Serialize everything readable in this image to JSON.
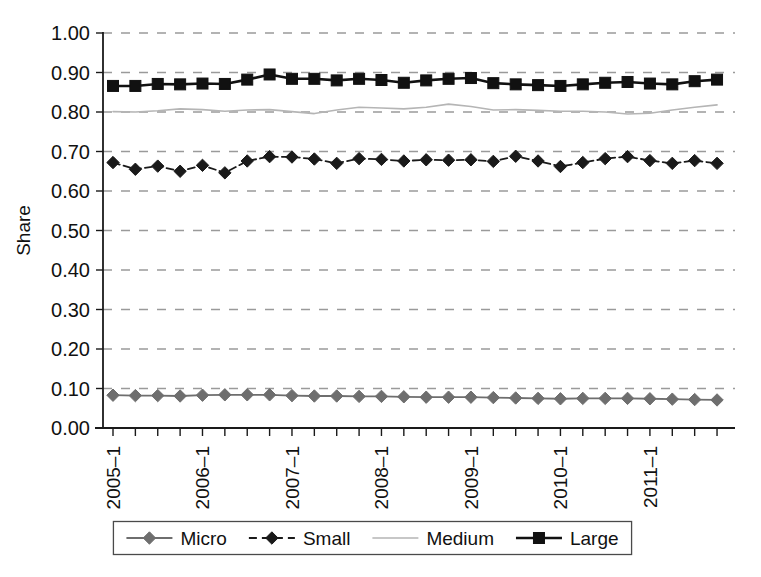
{
  "figure": {
    "background": "#ffffff",
    "axis_color": "#1a1a1a",
    "grid_color": "#9a9a9a"
  },
  "chart_data": {
    "type": "line",
    "title": "",
    "xlabel": "",
    "ylabel": "Share",
    "ylim": [
      0.0,
      1.0
    ],
    "ytick_labels": [
      "1.00",
      "0.90",
      "0.80",
      "0.70",
      "0.60",
      "0.50",
      "0.40",
      "0.30",
      "0.20",
      "0.10",
      "0.00"
    ],
    "ytick_values": [
      1.0,
      0.9,
      0.8,
      0.7,
      0.6,
      0.5,
      0.4,
      0.3,
      0.2,
      0.1,
      0.0
    ],
    "grid": true,
    "grid_style": "dashed-horizontal",
    "legend_position": "bottom-outside",
    "x": [
      "2005-1",
      "2005-2",
      "2005-3",
      "2005-4",
      "2006-1",
      "2006-2",
      "2006-3",
      "2006-4",
      "2007-1",
      "2007-2",
      "2007-3",
      "2007-4",
      "2008-1",
      "2008-2",
      "2008-3",
      "2008-4",
      "2009-1",
      "2009-2",
      "2009-3",
      "2009-4",
      "2010-1",
      "2010-2",
      "2010-3",
      "2010-4",
      "2011-1",
      "2011-2",
      "2011-3",
      "2011-4"
    ],
    "xtick_labels_shown": [
      "2005–1",
      "2006–1",
      "2007–1",
      "2008–1",
      "2009–1",
      "2010–1",
      "2011–1"
    ],
    "xtick_label_indices": [
      0,
      4,
      8,
      12,
      16,
      20,
      24
    ],
    "xtick_label_rotation": -90,
    "series": [
      {
        "name": "Micro",
        "color": "#6e6e6e",
        "marker": "diamond",
        "line_style": "solid",
        "line_width": 1.8,
        "values": [
          0.083,
          0.082,
          0.082,
          0.081,
          0.083,
          0.084,
          0.084,
          0.084,
          0.082,
          0.081,
          0.081,
          0.08,
          0.08,
          0.079,
          0.078,
          0.078,
          0.078,
          0.077,
          0.076,
          0.075,
          0.074,
          0.075,
          0.075,
          0.075,
          0.074,
          0.073,
          0.072,
          0.071
        ]
      },
      {
        "name": "Small",
        "color": "#1a1a1a",
        "marker": "diamond",
        "line_style": "dashed",
        "line_width": 1.8,
        "values": [
          0.672,
          0.655,
          0.663,
          0.65,
          0.665,
          0.646,
          0.676,
          0.687,
          0.686,
          0.681,
          0.67,
          0.682,
          0.68,
          0.676,
          0.679,
          0.678,
          0.679,
          0.675,
          0.688,
          0.676,
          0.662,
          0.672,
          0.682,
          0.687,
          0.677,
          0.67,
          0.677,
          0.67
        ]
      },
      {
        "name": "Medium",
        "color": "#b5b5b5",
        "marker": "none",
        "line_style": "solid",
        "line_width": 1.6,
        "values": [
          0.801,
          0.8,
          0.803,
          0.808,
          0.806,
          0.802,
          0.805,
          0.806,
          0.801,
          0.796,
          0.805,
          0.812,
          0.81,
          0.808,
          0.812,
          0.82,
          0.814,
          0.805,
          0.806,
          0.804,
          0.802,
          0.802,
          0.8,
          0.795,
          0.797,
          0.805,
          0.812,
          0.818
        ]
      },
      {
        "name": "Large",
        "color": "#111111",
        "marker": "square",
        "line_style": "solid",
        "line_width": 2.6,
        "values": [
          0.866,
          0.866,
          0.871,
          0.87,
          0.872,
          0.871,
          0.882,
          0.895,
          0.884,
          0.884,
          0.88,
          0.884,
          0.881,
          0.874,
          0.88,
          0.884,
          0.886,
          0.873,
          0.87,
          0.868,
          0.866,
          0.87,
          0.874,
          0.876,
          0.872,
          0.87,
          0.878,
          0.882
        ]
      }
    ]
  },
  "legend": {
    "items": [
      {
        "label": "Micro",
        "color": "#6e6e6e",
        "marker": "diamond",
        "line_style": "solid"
      },
      {
        "label": "Small",
        "color": "#1a1a1a",
        "marker": "diamond",
        "line_style": "dashed"
      },
      {
        "label": "Medium",
        "color": "#b5b5b5",
        "marker": "none",
        "line_style": "solid"
      },
      {
        "label": "Large",
        "color": "#111111",
        "marker": "square",
        "line_style": "solid"
      }
    ]
  }
}
